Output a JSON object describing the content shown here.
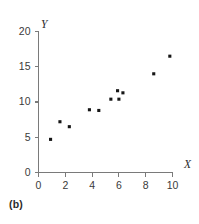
{
  "panel": {
    "label": "(b)"
  },
  "chart_data": {
    "type": "scatter",
    "title": "",
    "xlabel": "X",
    "ylabel": "Y",
    "xlim": [
      0,
      10
    ],
    "ylim": [
      0,
      20
    ],
    "xticks": [
      0,
      2,
      4,
      6,
      8,
      10
    ],
    "yticks": [
      0,
      5,
      10,
      15,
      20
    ],
    "xtick_labels": [
      "0",
      "2",
      "4",
      "6",
      "8",
      "10"
    ],
    "ytick_labels": [
      "0",
      "5",
      "10",
      "15",
      "20"
    ],
    "grid": false,
    "legend": null,
    "marker": "square",
    "marker_color": "#161616",
    "points": [
      {
        "x": 0.9,
        "y": 4.7
      },
      {
        "x": 1.6,
        "y": 7.2
      },
      {
        "x": 2.3,
        "y": 6.5
      },
      {
        "x": 3.8,
        "y": 8.9
      },
      {
        "x": 4.5,
        "y": 8.8
      },
      {
        "x": 5.4,
        "y": 10.4
      },
      {
        "x": 6.0,
        "y": 10.4
      },
      {
        "x": 5.9,
        "y": 11.6
      },
      {
        "x": 6.3,
        "y": 11.3
      },
      {
        "x": 8.6,
        "y": 14.0
      },
      {
        "x": 9.8,
        "y": 16.5
      }
    ]
  },
  "colors": {
    "axis": "#7a7a7a",
    "text": "#2b2b2b",
    "marker": "#161616",
    "background": "#ffffff"
  }
}
